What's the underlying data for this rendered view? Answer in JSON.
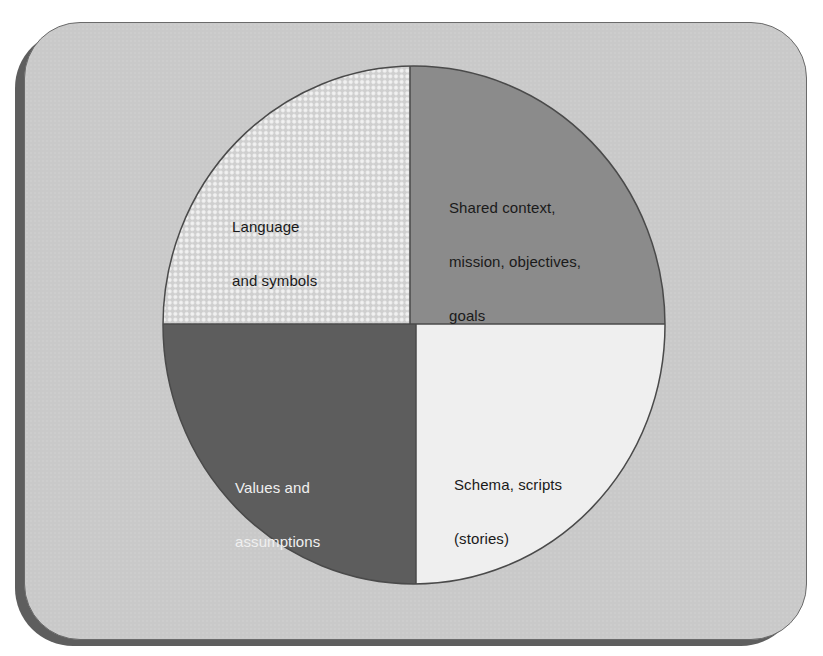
{
  "diagram": {
    "type": "quadrant-pie",
    "colors": {
      "background": "#ffffff",
      "panel": "#c9c9c9",
      "panel_shadow": "#5e5e5e",
      "outline": "#4a4a4a"
    },
    "quadrants": [
      {
        "position": "top-left",
        "label_lines": [
          "Language",
          "and symbols"
        ],
        "fill": "checkered-light-gray",
        "fill_color": "#d6d6d6",
        "text_color": "#1a1a1a"
      },
      {
        "position": "top-right",
        "label_lines": [
          "Shared context,",
          "mission, objectives,",
          "goals"
        ],
        "fill": "solid",
        "fill_color": "#8b8b8b",
        "text_color": "#1a1a1a"
      },
      {
        "position": "bottom-left",
        "label_lines": [
          "Values and",
          "assumptions"
        ],
        "fill": "solid",
        "fill_color": "#5d5d5d",
        "text_color": "#f0f0f0"
      },
      {
        "position": "bottom-right",
        "label_lines": [
          "Schema, scripts",
          "(stories)"
        ],
        "fill": "solid",
        "fill_color": "#efefef",
        "text_color": "#1a1a1a"
      }
    ]
  }
}
